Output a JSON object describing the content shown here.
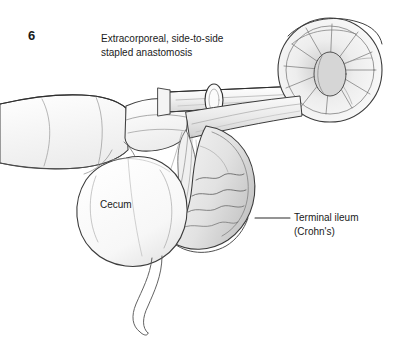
{
  "figure": {
    "number": "6",
    "caption_line1": "Extracorporeal, side-to-side",
    "caption_line2": "stapled anastomosis",
    "caption": "Extracorporeal, side-to-side\nstapled anastomosis"
  },
  "labels": {
    "cecum": "Cecum",
    "terminal_ileum_line1": "Terminal ileum",
    "terminal_ileum_line2": "(Crohn's)",
    "terminal_ileum": "Terminal ileum\n(Crohn's)"
  },
  "illustration": {
    "title": "surgical-illustration-ileocolic-anastomosis",
    "description": "Pencil line drawing of a surgeon's gloved hand holding exteriorized bowel with a linear stapler across the side-to-side anastomosis; cecum at lower left, appendix hanging below, thickened terminal ileum at right, open cut bowel end upper right.",
    "structures": [
      "surgeon-hand",
      "linear-stapler",
      "stapled-anastomosis-line",
      "cecum",
      "appendix",
      "terminal-ileum",
      "mesentery",
      "open-bowel-end"
    ]
  },
  "colors": {
    "background": "#ffffff",
    "ink": "#3a3a3a",
    "ink_dark": "#1a1a1a",
    "shade_light": "#f2f2f2",
    "shade_mid": "#dcdcdc",
    "shade_dark": "#b8b8b8",
    "leader_line": "#2b2b2b"
  }
}
